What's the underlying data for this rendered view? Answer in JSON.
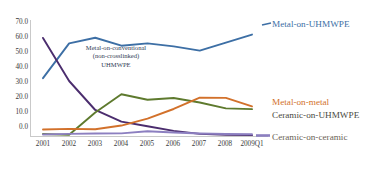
{
  "chart_data": {
    "type": "line",
    "title": "",
    "subtitle": "",
    "xlabel": "",
    "ylabel": "",
    "ylim": [
      0,
      70
    ],
    "yticks": [
      "0.0",
      "10.0",
      "20.0",
      "30.0",
      "40.0",
      "50.0",
      "60.0",
      "70.0"
    ],
    "ytick_values": [
      0,
      10,
      20,
      30,
      40,
      50,
      60,
      70
    ],
    "grid": false,
    "legend_position": "right-inline",
    "categories": [
      "2001",
      "2002",
      "2003",
      "2004",
      "2005",
      "2006",
      "2007",
      "2008",
      "2009Q1"
    ],
    "series": [
      {
        "name": "Metal-on-UHMWPE",
        "color": "#3D6FA5",
        "values": [
          35.2,
          56.2,
          59.6,
          54.8,
          56.2,
          54.4,
          51.8,
          56.6,
          61.5
        ]
      },
      {
        "name": "Metal-on-conventional (non-crosslinked) UHMWPE",
        "color": "#4B2D6E",
        "values": [
          59.5,
          33.5,
          16.0,
          9.0,
          6.2,
          3.4,
          1.6,
          1.0,
          0.8
        ]
      },
      {
        "name": "Ceramic-on-UHMWPE",
        "color": "#5E7A2E",
        "values": [
          1.5,
          1.0,
          14.5,
          25.5,
          22.2,
          23.2,
          20.5,
          17.0,
          16.5
        ]
      },
      {
        "name": "Metal-on-metal",
        "color": "#D2712B",
        "values": [
          4.2,
          4.6,
          4.4,
          6.6,
          10.8,
          16.6,
          23.4,
          23.3,
          18.2
        ]
      },
      {
        "name": "Ceramic-on-ceramic",
        "color": "#8C7FC0",
        "values": [
          1.2,
          1.6,
          1.8,
          1.9,
          3.2,
          2.4,
          1.8,
          1.5,
          1.4
        ]
      }
    ],
    "annotations": [
      {
        "name": "metal-on-conventional-annotation",
        "lines": [
          "Metal-on-conventional",
          "(non-crosslinked)",
          "UHMWPE"
        ],
        "color": "#2f3b55"
      }
    ],
    "series_labels": [
      {
        "name": "Metal-on-UHMWPE",
        "color": "#3D6FA5"
      },
      {
        "name": "Metal-on-metal",
        "color": "#D2712B"
      },
      {
        "name": "Ceramic-on-UHMWPE",
        "color": "#4a4a3f"
      },
      {
        "name": "Ceramic-on-ceramic",
        "color": "#6b6356"
      }
    ]
  }
}
